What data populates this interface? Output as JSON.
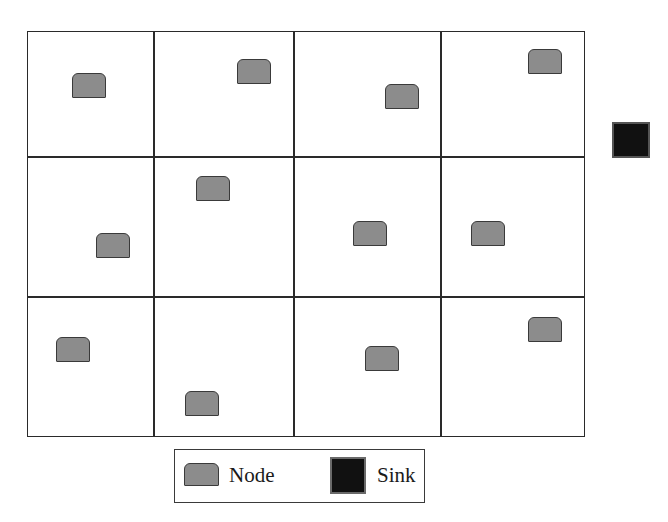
{
  "diagram": {
    "type": "grid-sensor-network",
    "grid": {
      "rows": 3,
      "cols": 4,
      "x": 27,
      "y": 31,
      "width": 558,
      "height": 406,
      "col_dividers": [
        153,
        293,
        440
      ],
      "row_dividers": [
        156,
        296
      ],
      "line_color": "#2a2a2a"
    },
    "nodes": [
      {
        "row": 1,
        "col": 1,
        "x": 72,
        "y": 73
      },
      {
        "row": 1,
        "col": 2,
        "x": 237,
        "y": 59
      },
      {
        "row": 1,
        "col": 3,
        "x": 385,
        "y": 84
      },
      {
        "row": 1,
        "col": 4,
        "x": 528,
        "y": 49
      },
      {
        "row": 2,
        "col": 1,
        "x": 96,
        "y": 233
      },
      {
        "row": 2,
        "col": 2,
        "x": 196,
        "y": 176
      },
      {
        "row": 2,
        "col": 3,
        "x": 353,
        "y": 221
      },
      {
        "row": 2,
        "col": 4,
        "x": 471,
        "y": 221
      },
      {
        "row": 3,
        "col": 1,
        "x": 56,
        "y": 337
      },
      {
        "row": 3,
        "col": 2,
        "x": 185,
        "y": 391
      },
      {
        "row": 3,
        "col": 3,
        "x": 365,
        "y": 346
      },
      {
        "row": 3,
        "col": 4,
        "x": 528,
        "y": 317
      }
    ],
    "node_style": {
      "fill": "#8c8c8c",
      "stroke": "#3a3a3a",
      "shape": "rounded-top-rectangle"
    },
    "sink": {
      "x": 612,
      "y": 122,
      "fill": "#111111",
      "stroke": "#555555",
      "position": "outside-grid-right"
    }
  },
  "legend": {
    "items": [
      {
        "icon": "node-icon",
        "label": "Node"
      },
      {
        "icon": "sink-icon",
        "label": "Sink"
      }
    ]
  }
}
